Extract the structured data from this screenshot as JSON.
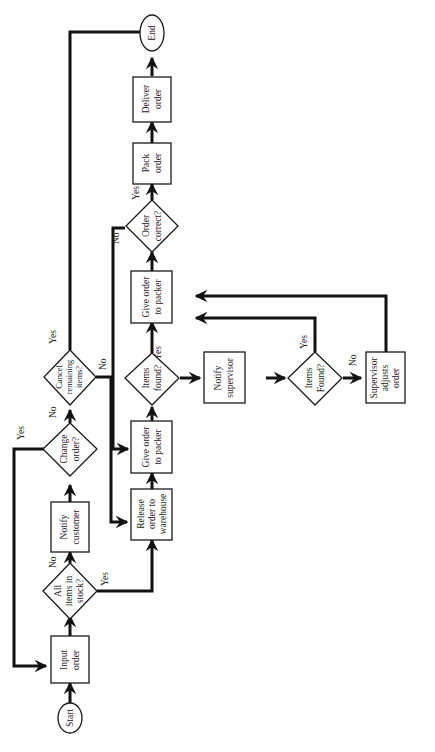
{
  "diagram": {
    "type": "flowchart",
    "orientation": "rotated-90-ccw",
    "colors": {
      "stroke": "#111111",
      "fill": "#ffffff",
      "text": "#222222"
    },
    "nodes": {
      "start": {
        "shape": "oval",
        "lines": [
          "Start"
        ]
      },
      "input_order": {
        "shape": "rect",
        "lines": [
          "Input",
          "order"
        ]
      },
      "all_in_stock": {
        "shape": "diamond",
        "lines": [
          "All",
          "items in",
          "stock?"
        ]
      },
      "notify_customer": {
        "shape": "rect",
        "lines": [
          "Notify",
          "customer"
        ]
      },
      "change_order": {
        "shape": "diamond",
        "lines": [
          "Change",
          "order?"
        ]
      },
      "cancel_remaining": {
        "shape": "diamond",
        "lines": [
          "Cancel",
          "remaining",
          "items?"
        ]
      },
      "release_order": {
        "shape": "rect",
        "lines": [
          "Release",
          "order to",
          "warehouse"
        ]
      },
      "give_packer_1": {
        "shape": "rect",
        "lines": [
          "Give order",
          "to packer"
        ]
      },
      "items_found_1": {
        "shape": "diamond",
        "lines": [
          "Items",
          "found?"
        ]
      },
      "notify_supervisor": {
        "shape": "rect",
        "lines": [
          "Notify",
          "supervisor"
        ]
      },
      "items_found_2": {
        "shape": "diamond",
        "lines": [
          "Items",
          "Found?"
        ]
      },
      "supervisor_adjusts": {
        "shape": "rect",
        "lines": [
          "Supervisor",
          "adjusts",
          "order"
        ]
      },
      "give_packer_2": {
        "shape": "rect",
        "lines": [
          "Give order",
          "to packer"
        ]
      },
      "order_correct": {
        "shape": "diamond",
        "lines": [
          "Order",
          "correct?"
        ]
      },
      "pack_order": {
        "shape": "rect",
        "lines": [
          "Pack",
          "order"
        ]
      },
      "deliver_order": {
        "shape": "rect",
        "lines": [
          "Deliver",
          "order"
        ]
      },
      "end": {
        "shape": "oval",
        "lines": [
          "End"
        ]
      }
    },
    "edges": [
      {
        "from": "start",
        "to": "input_order",
        "label": ""
      },
      {
        "from": "input_order",
        "to": "all_in_stock",
        "label": ""
      },
      {
        "from": "all_in_stock",
        "to": "notify_customer",
        "label": "No"
      },
      {
        "from": "all_in_stock",
        "to": "release_order",
        "label": "Yes"
      },
      {
        "from": "notify_customer",
        "to": "change_order",
        "label": ""
      },
      {
        "from": "change_order",
        "to": "input_order",
        "label": "Yes"
      },
      {
        "from": "change_order",
        "to": "cancel_remaining",
        "label": "No"
      },
      {
        "from": "cancel_remaining",
        "to": "end",
        "label": "Yes"
      },
      {
        "from": "cancel_remaining",
        "to": "release_order",
        "label": "No"
      },
      {
        "from": "release_order",
        "to": "give_packer_1",
        "label": ""
      },
      {
        "from": "give_packer_1",
        "to": "items_found_1",
        "label": ""
      },
      {
        "from": "items_found_1",
        "to": "give_packer_2",
        "label": "Yes"
      },
      {
        "from": "items_found_1",
        "to": "notify_supervisor",
        "label": "No"
      },
      {
        "from": "notify_supervisor",
        "to": "items_found_2",
        "label": ""
      },
      {
        "from": "items_found_2",
        "to": "give_packer_2",
        "label": "Yes"
      },
      {
        "from": "items_found_2",
        "to": "supervisor_adjusts",
        "label": "No"
      },
      {
        "from": "supervisor_adjusts",
        "to": "give_packer_2",
        "label": ""
      },
      {
        "from": "give_packer_2",
        "to": "order_correct",
        "label": ""
      },
      {
        "from": "order_correct",
        "to": "pack_order",
        "label": "Yes"
      },
      {
        "from": "order_correct",
        "to": "give_packer_1",
        "label": "No"
      },
      {
        "from": "pack_order",
        "to": "deliver_order",
        "label": ""
      },
      {
        "from": "deliver_order",
        "to": "end",
        "label": ""
      }
    ],
    "edge_labels": {
      "yes": "Yes",
      "no": "No"
    }
  }
}
